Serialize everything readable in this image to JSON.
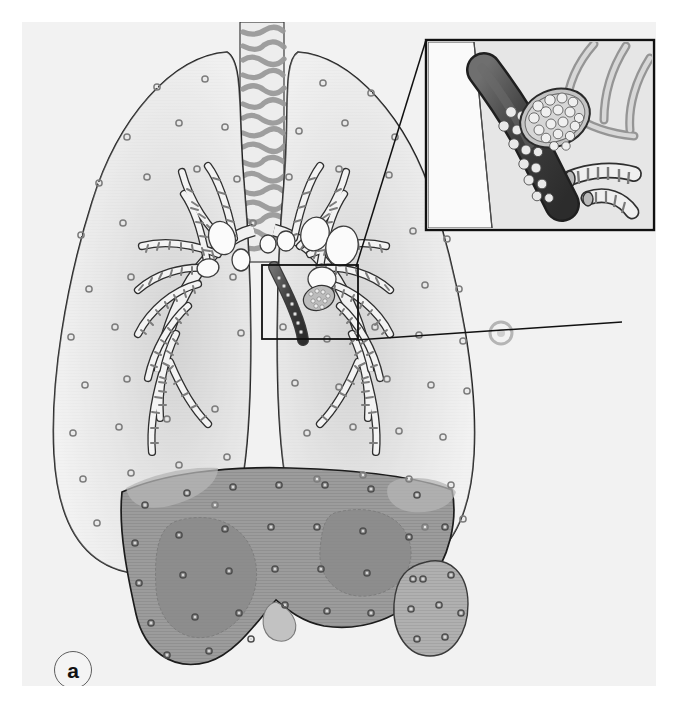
{
  "figure": {
    "panel_label": "a",
    "domain": "medical-illustration",
    "style": "grayscale line drawing with halftone shading",
    "background_color": "#ffffff",
    "panel_color": "#f2f2f2",
    "ink_color": "#1a1a1a"
  },
  "anatomy": {
    "trachea": {
      "name": "trachea",
      "description": "vertical airway with horizontal cartilage rings",
      "ring_count": 17,
      "fill_color": "#e8e8e8",
      "ring_color": "#9e9e9e"
    },
    "left_lung": {
      "name": "left lung",
      "fill_color": "#ededed",
      "outline_color": "#1e1e1e"
    },
    "right_lung": {
      "name": "right lung",
      "fill_color": "#ededed",
      "outline_color": "#1e1e1e"
    },
    "bronchial_tree": {
      "name": "bronchial tree",
      "description": "branching segmented bronchi with cartilage ring banding",
      "fill_color": "#f0f0f0",
      "band_color": "#8f8f8f"
    },
    "lymph_nodes": {
      "name": "hilar lymph nodes",
      "count": 8,
      "fill_color": "#fafafa",
      "outline_color": "#3a3a3a"
    },
    "liver": {
      "name": "liver",
      "fill_color": "#9b9b9b",
      "lobe_shadow_color": "#8a8a8a",
      "outline_color": "#1e1e1e"
    },
    "spleen": {
      "name": "spleen",
      "fill_color": "#adadad",
      "outline_color": "#3a3a3a"
    },
    "nodules": {
      "name": "disseminated miliary nodules",
      "description": "small gray rings scattered through lungs, liver and spleen",
      "ring_color": "#7b7b7b"
    }
  },
  "inset": {
    "name": "magnified bronchus detail",
    "border_color": "#111111",
    "background_color": "#f6f6f6",
    "leader_line_color": "#111111",
    "contents": {
      "bronchus_lumen": "dark bronchus filled with pale round granulomatous nodules",
      "cross_section": "oval cut face packed with clustered nodules",
      "surrounding_bronchi": "pale banded small airways",
      "lumen_color": "#4a4a4a",
      "nodule_color": "#e6e6e6"
    }
  },
  "source_box": {
    "name": "magnification source region",
    "border_color": "#111111",
    "description": "rectangle over the left main bronchus marking the inset origin"
  }
}
